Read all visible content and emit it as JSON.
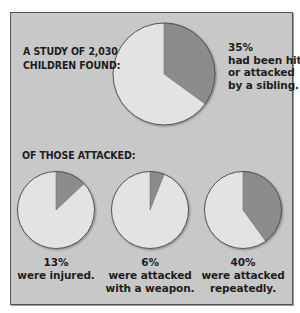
{
  "colors": {
    "page_background": "#ffffff",
    "panel_background": "#c8c8c8",
    "border": "#555555",
    "slice_highlight": "#8c8c8c",
    "slice_remainder": "#e3e3e3",
    "pie_outline": "#555555",
    "text": "#1e1e1e"
  },
  "heading": {
    "line1": "A STUDY OF 2,030",
    "line2": "CHILDREN FOUND:"
  },
  "main_pie": {
    "percent_label": "35%",
    "line1": "had been hit",
    "line2": "or attacked",
    "line3": "by a sibling."
  },
  "subheading": "OF THOSE ATTACKED:",
  "sub_pies": [
    {
      "percent_label": "13%",
      "line1": "were injured.",
      "line2": ""
    },
    {
      "percent_label": "6%",
      "line1": "were attacked",
      "line2": "with a weapon."
    },
    {
      "percent_label": "40%",
      "line1": "were attacked",
      "line2": "repeatedly."
    }
  ],
  "chart_data": [
    {
      "type": "pie",
      "title": "A STUDY OF 2,030 CHILDREN FOUND:",
      "categories": [
        "had been hit or attacked by a sibling",
        "not attacked"
      ],
      "values": [
        35,
        65
      ],
      "annotation": "35% had been hit or attacked by a sibling."
    },
    {
      "type": "pie",
      "title": "OF THOSE ATTACKED:",
      "categories": [
        "were injured",
        "not injured"
      ],
      "values": [
        13,
        87
      ],
      "annotation": "13% were injured."
    },
    {
      "type": "pie",
      "title": "OF THOSE ATTACKED:",
      "categories": [
        "were attacked with a weapon",
        "no weapon"
      ],
      "values": [
        6,
        94
      ],
      "annotation": "6% were attacked with a weapon."
    },
    {
      "type": "pie",
      "title": "OF THOSE ATTACKED:",
      "categories": [
        "were attacked repeatedly",
        "not repeatedly"
      ],
      "values": [
        40,
        60
      ],
      "annotation": "40% were attacked repeatedly."
    }
  ]
}
